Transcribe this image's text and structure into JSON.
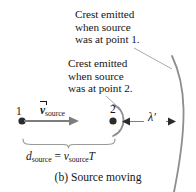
{
  "figure": {
    "caption": "(b) Source moving",
    "annotations": {
      "crest1": "Crest emitted\nwhen source\nwas at point 1.",
      "crest2": "Crest emitted\nwhen source\nwas at point 2."
    },
    "labels": {
      "point1": "1",
      "point2": "2",
      "velocity_symbol": "v",
      "velocity_subscript": "source",
      "wavelength": "λ′",
      "distance_symbol": "d",
      "distance_subscript": "source",
      "equals": "=",
      "speed_symbol": "v",
      "speed_subscript": "source",
      "period_symbol": "T"
    },
    "colors": {
      "background": "#ffffff",
      "ink": "#161616",
      "arc_gray": "#8a8a8a",
      "arrow_gray": "#7d7d7d",
      "dot_dark": "#2b2b2b",
      "leader_gray": "#9a9a9a"
    }
  }
}
